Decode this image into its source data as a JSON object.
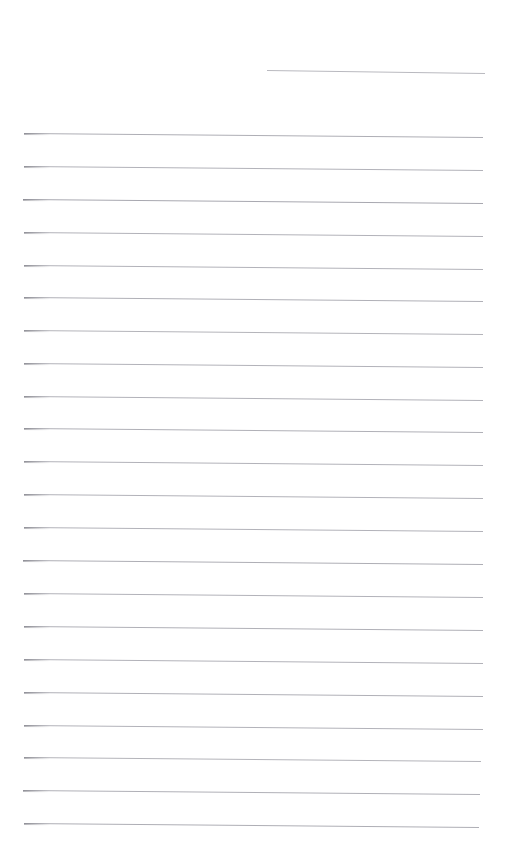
{
  "document": {
    "kind": "lined-paper-sheet",
    "title": "Blank ruled notebook page",
    "page_width": 505,
    "page_height": 857,
    "background_color": "#ffffff",
    "rule_color": "#b4b4ba",
    "rule_color_strong": "#9a9aa2",
    "rule_thickness_px": 1,
    "body_text": "",
    "line_count": 23
  },
  "rules": [
    {
      "name": "header-rule",
      "x": 267,
      "y": 70,
      "width": 218,
      "slope_px": 3,
      "color": "#b9b9bf",
      "thickness": 1,
      "nib": false
    },
    {
      "name": "rule-1",
      "x": 24,
      "y": 133,
      "width": 459,
      "slope_px": 4,
      "color": "#aeaeb5",
      "thickness": 1,
      "nib": true
    },
    {
      "name": "rule-2",
      "x": 24,
      "y": 166,
      "width": 459,
      "slope_px": 4,
      "color": "#b2b2b9",
      "thickness": 1,
      "nib": true
    },
    {
      "name": "rule-3",
      "x": 23,
      "y": 199,
      "width": 460,
      "slope_px": 4,
      "color": "#a8a8b0",
      "thickness": 1,
      "nib": true
    },
    {
      "name": "rule-4",
      "x": 24,
      "y": 232,
      "width": 459,
      "slope_px": 4,
      "color": "#b2b2b9",
      "thickness": 1,
      "nib": true
    },
    {
      "name": "rule-5",
      "x": 24,
      "y": 265,
      "width": 459,
      "slope_px": 4,
      "color": "#b2b2b9",
      "thickness": 1,
      "nib": true
    },
    {
      "name": "rule-6",
      "x": 24,
      "y": 297,
      "width": 459,
      "slope_px": 4,
      "color": "#b0b0b7",
      "thickness": 1,
      "nib": true
    },
    {
      "name": "rule-7",
      "x": 24,
      "y": 330,
      "width": 459,
      "slope_px": 4,
      "color": "#b4b4ba",
      "thickness": 1,
      "nib": true
    },
    {
      "name": "rule-8",
      "x": 24,
      "y": 363,
      "width": 459,
      "slope_px": 4,
      "color": "#b2b2b9",
      "thickness": 1,
      "nib": true
    },
    {
      "name": "rule-9",
      "x": 24,
      "y": 396,
      "width": 459,
      "slope_px": 4,
      "color": "#b2b2b9",
      "thickness": 1,
      "nib": true
    },
    {
      "name": "rule-10",
      "x": 24,
      "y": 428,
      "width": 459,
      "slope_px": 4,
      "color": "#b0b0b7",
      "thickness": 1,
      "nib": true
    },
    {
      "name": "rule-11",
      "x": 24,
      "y": 461,
      "width": 459,
      "slope_px": 4,
      "color": "#b2b2b9",
      "thickness": 1,
      "nib": true
    },
    {
      "name": "rule-12",
      "x": 24,
      "y": 494,
      "width": 459,
      "slope_px": 4,
      "color": "#b2b2b9",
      "thickness": 1,
      "nib": true
    },
    {
      "name": "rule-13",
      "x": 24,
      "y": 527,
      "width": 459,
      "slope_px": 4,
      "color": "#b2b2b9",
      "thickness": 1,
      "nib": true
    },
    {
      "name": "rule-14",
      "x": 23,
      "y": 560,
      "width": 460,
      "slope_px": 4,
      "color": "#aeaeb5",
      "thickness": 1,
      "nib": true
    },
    {
      "name": "rule-15",
      "x": 24,
      "y": 593,
      "width": 459,
      "slope_px": 4,
      "color": "#b2b2b9",
      "thickness": 1,
      "nib": true
    },
    {
      "name": "rule-16",
      "x": 24,
      "y": 626,
      "width": 459,
      "slope_px": 4,
      "color": "#b0b0b7",
      "thickness": 1,
      "nib": true
    },
    {
      "name": "rule-17",
      "x": 24,
      "y": 659,
      "width": 459,
      "slope_px": 4,
      "color": "#b2b2b9",
      "thickness": 1,
      "nib": true
    },
    {
      "name": "rule-18",
      "x": 24,
      "y": 692,
      "width": 459,
      "slope_px": 4,
      "color": "#b0b0b7",
      "thickness": 1,
      "nib": true
    },
    {
      "name": "rule-19",
      "x": 24,
      "y": 725,
      "width": 459,
      "slope_px": 4,
      "color": "#b2b2b9",
      "thickness": 1,
      "nib": true
    },
    {
      "name": "rule-20",
      "x": 24,
      "y": 757,
      "width": 457,
      "slope_px": 4,
      "color": "#b4b4ba",
      "thickness": 1,
      "nib": true
    },
    {
      "name": "rule-21",
      "x": 23,
      "y": 790,
      "width": 457,
      "slope_px": 4,
      "color": "#b0b0b7",
      "thickness": 1,
      "nib": true
    },
    {
      "name": "rule-22",
      "x": 24,
      "y": 823,
      "width": 455,
      "slope_px": 4,
      "color": "#aeaeb5",
      "thickness": 1,
      "nib": true
    }
  ]
}
